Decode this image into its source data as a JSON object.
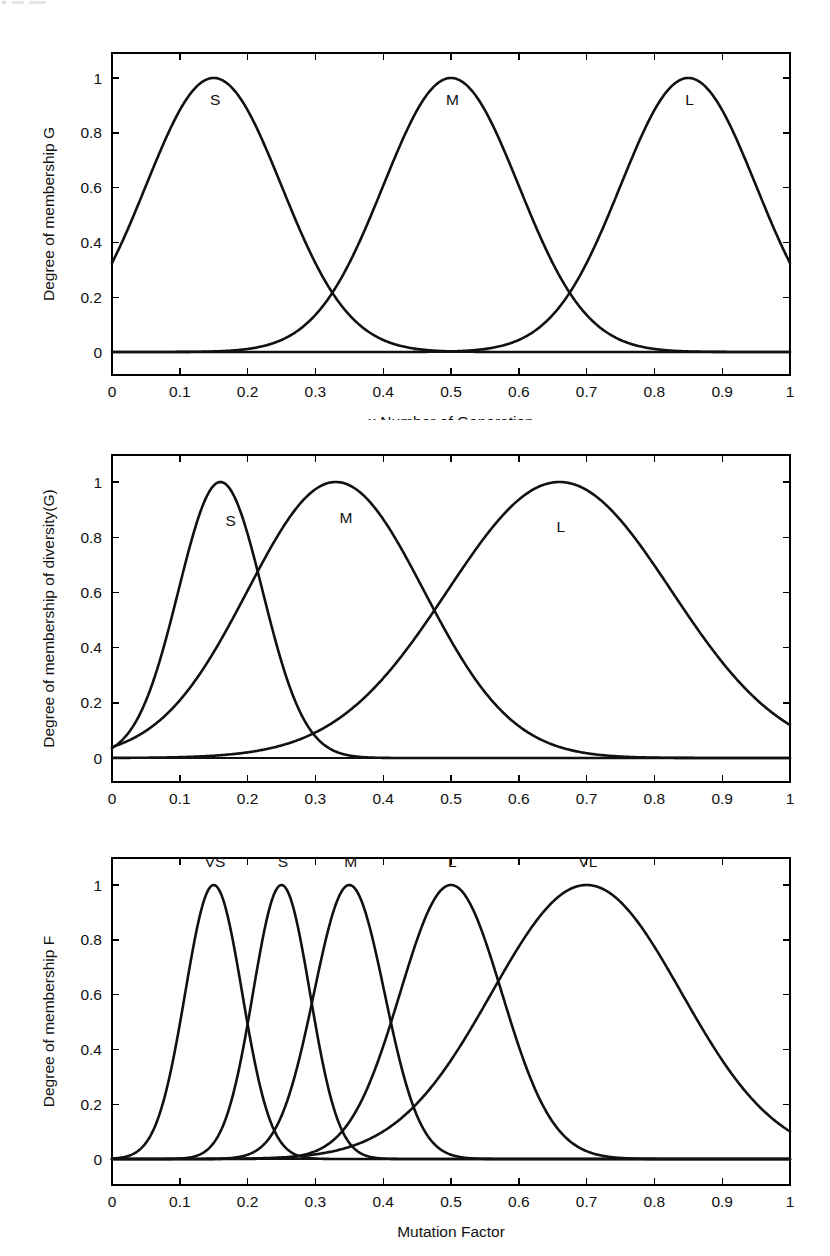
{
  "document": {
    "background_color": "#ffffff",
    "ink_color": "#111111",
    "figure_count": 3
  },
  "figures": [
    {
      "name": "generation-membership-plot",
      "box": {
        "left": 112,
        "top": 53,
        "right": 790,
        "bottom": 375
      },
      "y_one_px": 78,
      "y_zero_px": 352,
      "chart_data": {
        "type": "line",
        "title": "",
        "xlabel": "x Number of Generation",
        "ylabel": "Degree of membership G",
        "xlim": [
          0,
          1
        ],
        "ylim": [
          -0.05,
          1.12
        ],
        "grid": false,
        "legend": "inline-labels",
        "x_ticks": [
          "0",
          "0.1",
          "0.2",
          "0.3",
          "0.4",
          "0.5",
          "0.6",
          "0.7",
          "0.8",
          "0.9",
          "1"
        ],
        "x_tick_values": [
          0,
          0.1,
          0.2,
          0.3,
          0.4,
          0.5,
          0.6,
          0.7,
          0.8,
          0.9,
          1
        ],
        "y_ticks": [
          "0",
          "0.2",
          "0.4",
          "0.6",
          "0.8",
          "1"
        ],
        "y_tick_values": [
          0,
          0.2,
          0.4,
          0.6,
          0.8,
          1
        ],
        "series": [
          {
            "name": "S",
            "shape": "gaussmf",
            "mean": 0.15,
            "sigma": 0.1,
            "peak": 1.0,
            "label": "S",
            "label_x": 0.152,
            "label_y": 0.92
          },
          {
            "name": "M",
            "shape": "gaussmf",
            "mean": 0.5,
            "sigma": 0.1,
            "peak": 1.0,
            "label": "M",
            "label_x": 0.502,
            "label_y": 0.92
          },
          {
            "name": "L",
            "shape": "gaussmf",
            "mean": 0.85,
            "sigma": 0.1,
            "peak": 1.0,
            "label": "L",
            "label_x": 0.852,
            "label_y": 0.92
          }
        ],
        "baseline_y": 0
      }
    },
    {
      "name": "diversity-membership-plot",
      "box": {
        "left": 112,
        "top": 455,
        "right": 790,
        "bottom": 782
      },
      "y_one_px": 482,
      "y_zero_px": 758,
      "chart_data": {
        "type": "line",
        "title": "",
        "xlabel": "x Max (diversity)",
        "ylabel": "Degree of membership of diversity(G)",
        "xlim": [
          0,
          1
        ],
        "ylim": [
          -0.05,
          1.12
        ],
        "grid": false,
        "legend": "inline-labels",
        "x_ticks": [
          "0",
          "0.1",
          "0.2",
          "0.3",
          "0.4",
          "0.5",
          "0.6",
          "0.7",
          "0.8",
          "0.9",
          "1"
        ],
        "x_tick_values": [
          0,
          0.1,
          0.2,
          0.3,
          0.4,
          0.5,
          0.6,
          0.7,
          0.8,
          0.9,
          1
        ],
        "y_ticks": [
          "0",
          "0.2",
          "0.4",
          "0.6",
          "0.8",
          "1"
        ],
        "y_tick_values": [
          0,
          0.2,
          0.4,
          0.6,
          0.8,
          1
        ],
        "series": [
          {
            "name": "S",
            "shape": "gaussmf",
            "mean": 0.16,
            "sigma": 0.062,
            "peak": 1.0,
            "label": "S",
            "label_x": 0.175,
            "label_y": 0.86
          },
          {
            "name": "M",
            "shape": "gaussmf",
            "mean": 0.33,
            "sigma": 0.13,
            "peak": 1.0,
            "label": "M",
            "label_x": 0.345,
            "label_y": 0.87
          },
          {
            "name": "L",
            "shape": "gaussmf",
            "mean": 0.66,
            "sigma": 0.165,
            "peak": 1.0,
            "label": "L",
            "label_x": 0.662,
            "label_y": 0.84
          }
        ],
        "baseline_y": 0
      }
    },
    {
      "name": "mutation-factor-membership-plot",
      "box": {
        "left": 112,
        "top": 858,
        "right": 790,
        "bottom": 1185
      },
      "y_one_px": 885,
      "y_zero_px": 1159,
      "chart_data": {
        "type": "line",
        "title": "",
        "xlabel": "Mutation Factor",
        "ylabel": "Degree of membership F",
        "xlim": [
          0,
          1
        ],
        "ylim": [
          -0.05,
          1.15
        ],
        "grid": false,
        "legend": "inline-labels",
        "x_ticks": [
          "0",
          "0.1",
          "0.2",
          "0.3",
          "0.4",
          "0.5",
          "0.6",
          "0.7",
          "0.8",
          "0.9",
          "1"
        ],
        "x_tick_values": [
          0,
          0.1,
          0.2,
          0.3,
          0.4,
          0.5,
          0.6,
          0.7,
          0.8,
          0.9,
          1
        ],
        "y_ticks": [
          "0",
          "0.2",
          "0.4",
          "0.6",
          "0.8",
          "1"
        ],
        "y_tick_values": [
          0,
          0.2,
          0.4,
          0.6,
          0.8,
          1
        ],
        "series": [
          {
            "name": "VS",
            "shape": "gaussmf",
            "mean": 0.15,
            "sigma": 0.042,
            "peak": 1.0,
            "label": "VS",
            "label_x": 0.152,
            "label_y": 1.085
          },
          {
            "name": "S",
            "shape": "gaussmf",
            "mean": 0.25,
            "sigma": 0.042,
            "peak": 1.0,
            "label": "S",
            "label_x": 0.252,
            "label_y": 1.085
          },
          {
            "name": "M",
            "shape": "gaussmf",
            "mean": 0.35,
            "sigma": 0.052,
            "peak": 1.0,
            "label": "M",
            "label_x": 0.352,
            "label_y": 1.085
          },
          {
            "name": "L",
            "shape": "gaussmf",
            "mean": 0.5,
            "sigma": 0.075,
            "peak": 1.0,
            "label": "L",
            "label_x": 0.502,
            "label_y": 1.085
          },
          {
            "name": "VL",
            "shape": "gaussmf",
            "mean": 0.7,
            "sigma": 0.14,
            "peak": 1.0,
            "label": "VL",
            "label_x": 0.702,
            "label_y": 1.085
          }
        ],
        "baseline_y": 0
      }
    }
  ]
}
